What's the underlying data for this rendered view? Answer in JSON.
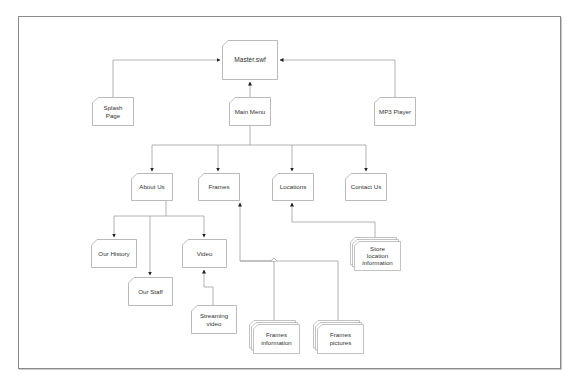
{
  "diagram": {
    "type": "site-map",
    "nodes": [
      {
        "id": "master",
        "label": "Master.swf",
        "kind": "page"
      },
      {
        "id": "splash",
        "label": "Splash\nPage",
        "kind": "page"
      },
      {
        "id": "main_menu",
        "label": "Main Menu",
        "kind": "page"
      },
      {
        "id": "mp3",
        "label": "MP3 Player",
        "kind": "page"
      },
      {
        "id": "about",
        "label": "About Us",
        "kind": "page"
      },
      {
        "id": "frames",
        "label": "Frames",
        "kind": "page"
      },
      {
        "id": "locations",
        "label": "Locations",
        "kind": "page"
      },
      {
        "id": "contact",
        "label": "Contact Us",
        "kind": "page"
      },
      {
        "id": "history",
        "label": "Our History",
        "kind": "page"
      },
      {
        "id": "staff",
        "label": "Our Staff",
        "kind": "page"
      },
      {
        "id": "video",
        "label": "Video",
        "kind": "page"
      },
      {
        "id": "streaming",
        "label": "Streaming\nvideo",
        "kind": "page"
      },
      {
        "id": "store_info",
        "label": "Store\nlocation\ninformation",
        "kind": "stacked"
      },
      {
        "id": "frames_info",
        "label": "Frames\ninformation",
        "kind": "stacked"
      },
      {
        "id": "frames_pics",
        "label": "Frames\npictures",
        "kind": "stacked"
      }
    ],
    "edges": [
      {
        "from": "splash",
        "to": "master"
      },
      {
        "from": "mp3",
        "to": "master"
      },
      {
        "from": "main_menu",
        "to": "master"
      },
      {
        "from": "main_menu",
        "to": "about"
      },
      {
        "from": "main_menu",
        "to": "frames"
      },
      {
        "from": "main_menu",
        "to": "locations"
      },
      {
        "from": "main_menu",
        "to": "contact"
      },
      {
        "from": "about",
        "to": "history"
      },
      {
        "from": "about",
        "to": "staff"
      },
      {
        "from": "about",
        "to": "video"
      },
      {
        "from": "streaming",
        "to": "video"
      },
      {
        "from": "store_info",
        "to": "locations"
      },
      {
        "from": "frames_info",
        "to": "frames"
      },
      {
        "from": "frames_pics",
        "to": "frames"
      }
    ],
    "colors": {
      "line": "#9a9a9a",
      "box": "#a8a8a8",
      "arrow": "#222222",
      "text": "#333333"
    }
  }
}
